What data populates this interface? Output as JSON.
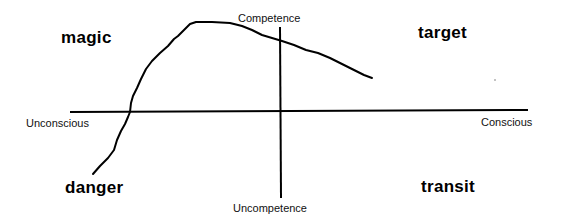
{
  "diagram": {
    "type": "quadrant-diagram",
    "axes": {
      "vertical": {
        "top_label": "Competence",
        "bottom_label": "Uncompetence"
      },
      "horizontal": {
        "left_label": "Unconscious",
        "right_label": "Conscious"
      }
    },
    "quadrants": {
      "top_left": "magic",
      "top_right": "target",
      "bottom_left": "danger",
      "bottom_right": "transit"
    },
    "curve": {
      "description": "hand-drawn curve rising from danger quadrant through magic, peaking near top, descending into target quadrant",
      "color": "#000000"
    },
    "colors": {
      "background": "#ffffff",
      "ink": "#000000"
    }
  }
}
